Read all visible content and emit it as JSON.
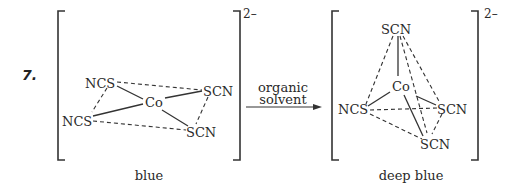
{
  "problem": {
    "number": "7."
  },
  "reactant": {
    "charge": "2–",
    "center": "Co",
    "ligands": [
      "NCS",
      "SCN",
      "NCS",
      "SCN"
    ],
    "geometry": "square planar",
    "color_label": "blue"
  },
  "arrow": {
    "line1": "organic",
    "line2": "solvent"
  },
  "product": {
    "charge": "2–",
    "center": "Co",
    "ligands": [
      "SCN",
      "NCS",
      "SCN",
      "SCN"
    ],
    "geometry": "tetrahedral",
    "color_label": "deep blue"
  }
}
